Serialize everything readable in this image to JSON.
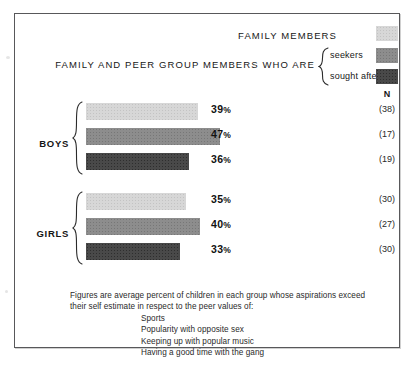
{
  "header": {
    "top_label": "FAMILY MEMBERS",
    "main_label": "FAMILY AND PEER GROUP MEMBERS WHO ARE",
    "legend_seekers": "seekers",
    "legend_sought_after": "sought after",
    "n_header": "N"
  },
  "colors": {
    "family_members": "#d7d7d7",
    "seekers": "#8d8d8d",
    "sought_after": "#494949",
    "frame": "#58585a",
    "text": "#171717"
  },
  "groups": [
    {
      "label": "BOYS"
    },
    {
      "label": "GIRLS"
    }
  ],
  "footnote": {
    "lead": "Figures are average percent of children in each group whose aspirations exceed their self estimate in respect to the peer values of:",
    "items": [
      "Sports",
      "Popularity with opposite sex",
      "Keeping up with popular music",
      "Having a good time with the gang"
    ]
  },
  "chart_data": {
    "type": "bar",
    "title": "FAMILY AND PEER GROUP MEMBERS WHO ARE",
    "xlabel": "",
    "ylabel": "",
    "xlim": [
      0,
      50
    ],
    "grid": false,
    "orientation": "horizontal",
    "legend_position": "top-right",
    "legend": [
      "FAMILY MEMBERS",
      "seekers",
      "sought after"
    ],
    "categories": [
      "BOYS",
      "GIRLS"
    ],
    "series": [
      {
        "name": "FAMILY MEMBERS",
        "color": "#d7d7d7",
        "values": [
          39,
          35
        ]
      },
      {
        "name": "seekers",
        "color": "#8d8d8d",
        "values": [
          47,
          40
        ]
      },
      {
        "name": "sought after",
        "color": "#494949",
        "values": [
          36,
          33
        ]
      }
    ],
    "bars": [
      {
        "group": "BOYS",
        "series": "FAMILY MEMBERS",
        "value": 39,
        "label": "39",
        "unit": "%",
        "n": "(38)",
        "fill": "light"
      },
      {
        "group": "BOYS",
        "series": "seekers",
        "value": 47,
        "label": "47",
        "unit": "%",
        "n": "(17)",
        "fill": "mid"
      },
      {
        "group": "BOYS",
        "series": "sought after",
        "value": 36,
        "label": "36",
        "unit": "%",
        "n": "(19)",
        "fill": "dark"
      },
      {
        "group": "GIRLS",
        "series": "FAMILY MEMBERS",
        "value": 35,
        "label": "35",
        "unit": "%",
        "n": "(30)",
        "fill": "light"
      },
      {
        "group": "GIRLS",
        "series": "seekers",
        "value": 40,
        "label": "40",
        "unit": "%",
        "n": "(27)",
        "fill": "mid"
      },
      {
        "group": "GIRLS",
        "series": "sought after",
        "value": 33,
        "label": "33",
        "unit": "%",
        "n": "(30)",
        "fill": "dark"
      }
    ],
    "annotation": "Figures are average percent of children in each group whose aspirations exceed their self estimate in respect to the peer values of: Sports; Popularity with opposite sex; Keeping up with popular music; Having a good time with the gang"
  }
}
